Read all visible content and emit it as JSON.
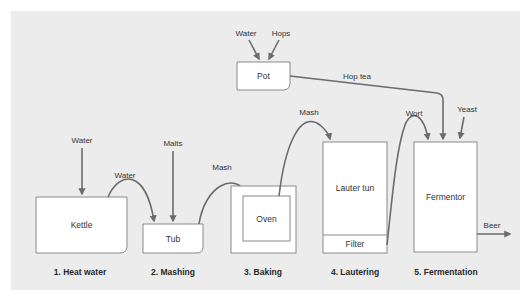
{
  "diagram": {
    "colors": {
      "panel": "#ececec",
      "box_fill": "#ffffff",
      "box_stroke": "#8a8a8a",
      "arrow": "#6b6b6b",
      "text": "#333333"
    },
    "vessels": {
      "pot": "Pot",
      "kettle": "Kettle",
      "tub": "Tub",
      "oven": "Oven",
      "lauter_tun": "Lauter tun",
      "filter": "Filter",
      "fermentor": "Fermentor"
    },
    "inputs": {
      "pot_water": "Water",
      "pot_hops": "Hops",
      "kettle_water": "Water",
      "tub_malts": "Malts",
      "fermentor_yeast": "Yeast"
    },
    "flows": {
      "kettle_to_tub": "Water",
      "tub_to_oven": "Mash",
      "oven_to_lauter": "Mash",
      "filter_to_fermentor": "Wort",
      "pot_to_fermentor": "Hop tea",
      "fermentor_out": "Beer"
    },
    "stages": [
      "1. Heat water",
      "2. Mashing",
      "3. Baking",
      "4. Lautering",
      "5. Fermentation"
    ]
  }
}
